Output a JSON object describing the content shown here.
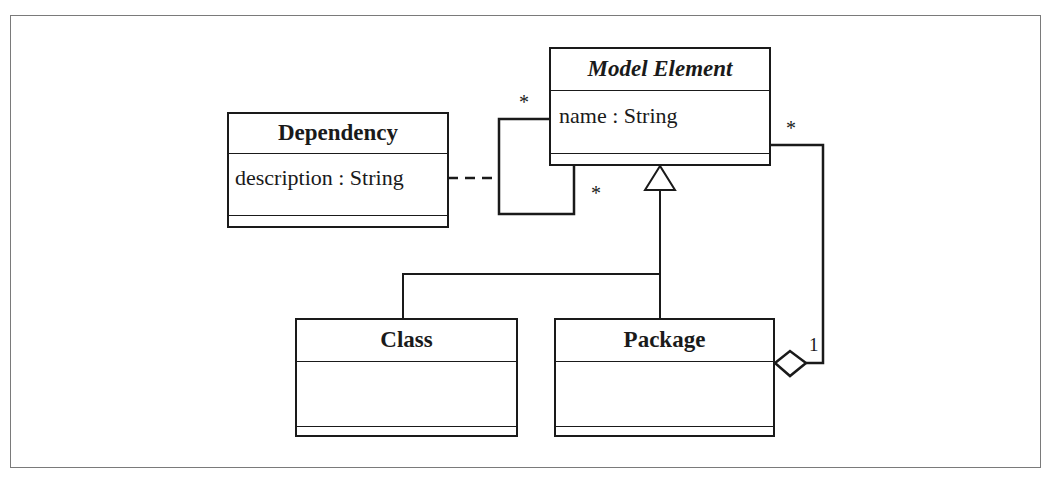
{
  "diagram": {
    "type": "UML class diagram",
    "classes": [
      {
        "id": "model_element",
        "name": "Model Element",
        "italic": true,
        "attributes": [
          "name : String"
        ],
        "operations": []
      },
      {
        "id": "dependency",
        "name": "Dependency",
        "italic": false,
        "attributes": [
          "description : String"
        ],
        "operations": []
      },
      {
        "id": "class",
        "name": "Class",
        "italic": false,
        "attributes": [],
        "operations": []
      },
      {
        "id": "package",
        "name": "Package",
        "italic": false,
        "attributes": [],
        "operations": []
      }
    ],
    "relationships": [
      {
        "type": "association",
        "from": "model_element",
        "to": "model_element",
        "from_multiplicity": "*",
        "to_multiplicity": "*",
        "association_class": "dependency"
      },
      {
        "type": "generalization",
        "child": "class",
        "parent": "model_element"
      },
      {
        "type": "generalization",
        "child": "package",
        "parent": "model_element"
      },
      {
        "type": "aggregation",
        "whole": "package",
        "part": "model_element",
        "whole_multiplicity": "1",
        "part_multiplicity": "*"
      }
    ],
    "multiplicities": {
      "self_top": "*",
      "self_bottom": "*",
      "aggregation_part": "*",
      "aggregation_whole": "1"
    },
    "colors": {
      "line": "#1a1a1a",
      "frame": "#7a7a7a",
      "background": "#ffffff"
    }
  }
}
